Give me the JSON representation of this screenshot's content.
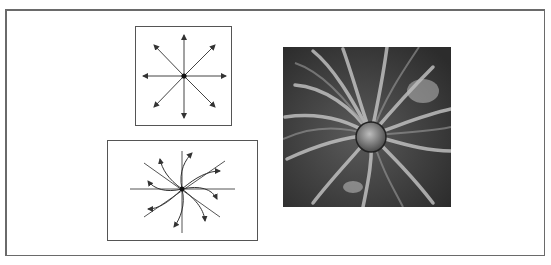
{
  "figure": {
    "panels": [
      {
        "id": "radial-field",
        "description": "Straight radial arrows diverging from a central point (8 directions)"
      },
      {
        "id": "spiral-field",
        "description": "Curved spiral arrows swirling out from a central point over crossed axes"
      },
      {
        "id": "photo",
        "description": "Grayscale photograph of a radial spiral pattern (gathered fabric / flower-like)"
      }
    ],
    "colors": {
      "line": "#333333",
      "frame": "#6a6a6a",
      "photo_dark": "#2a2a2a",
      "photo_light": "#d8d8d8"
    }
  }
}
